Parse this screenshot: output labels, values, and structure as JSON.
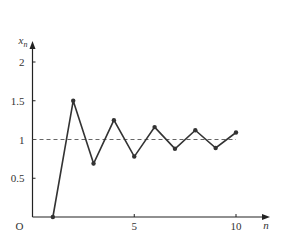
{
  "chart_data": {
    "type": "line",
    "title": "",
    "xlabel": "n",
    "ylabel": "x_n",
    "ylabel_main": "x",
    "ylabel_sub": "n",
    "origin_label": "O",
    "xlim": [
      0,
      11.5
    ],
    "ylim": [
      0,
      2.25
    ],
    "x_ticks": [
      5,
      10
    ],
    "x_tick_labels": [
      "5",
      "10"
    ],
    "y_ticks": [
      0.5,
      1,
      1.5,
      2
    ],
    "y_tick_labels": [
      "0.5",
      "1",
      "1.5",
      "2"
    ],
    "grid": false,
    "legend": null,
    "reference_line": {
      "y": 1,
      "style": "dashed",
      "x_range": [
        0,
        10
      ]
    },
    "x": [
      1,
      2,
      3,
      4,
      5,
      6,
      7,
      8,
      9,
      10
    ],
    "series": [
      {
        "name": "x_n",
        "values": [
          0,
          1.5,
          0.69,
          1.25,
          0.78,
          1.16,
          0.88,
          1.12,
          0.89,
          1.09
        ]
      }
    ]
  },
  "style": {
    "line_color": "#333333",
    "axis_color": "#222222",
    "dash_color": "#555555"
  }
}
